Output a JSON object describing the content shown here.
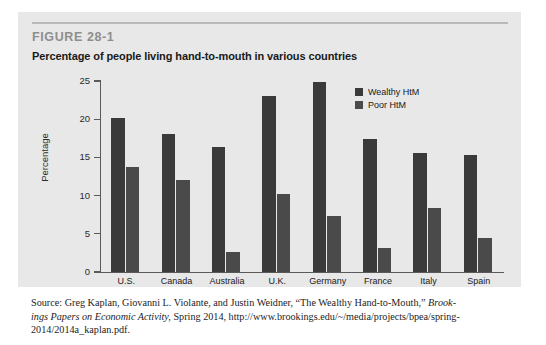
{
  "figure": {
    "number": "FIGURE 28-1",
    "title": "Percentage of people living hand-to-mouth in various countries"
  },
  "source": {
    "line1_pre": "Source: Greg Kaplan, Giovanni L. Violante, and Justin Weidner, “The Wealthy Hand-to-Mouth,” ",
    "line1_italic": "Brook-",
    "line2_italic": "ings Papers on Economic Activity,",
    "line2_post": " Spring 2014, http://www.brookings.edu/~/media/projects/bpea/spring-",
    "line3": "2014/2014a_kaplan.pdf."
  },
  "colors": {
    "panel_background": "#e8e8e8",
    "wealthy_bar": "#3a3a3a",
    "poor_bar": "#4a4a4a",
    "axis": "#5a5a5a",
    "figure_number": "#8e8e8e"
  },
  "chart_data": {
    "type": "bar",
    "title": "Percentage of people living hand-to-mouth in various countries",
    "xlabel": "",
    "ylabel": "Percentage",
    "ylim": [
      0,
      25
    ],
    "yticks": [
      0,
      5,
      10,
      15,
      20,
      25
    ],
    "ytick_labels": [
      "0",
      "5",
      "10",
      "15",
      "20",
      "25"
    ],
    "grid": false,
    "legend_position": "upper-right-inside",
    "categories": [
      "U.S.",
      "Canada",
      "Australia",
      "U.K.",
      "Germany",
      "France",
      "Italy",
      "Spain"
    ],
    "series": [
      {
        "name": "Wealthy HtM",
        "color": "#3a3a3a",
        "values": [
          20.2,
          18.0,
          16.4,
          23.1,
          24.9,
          17.4,
          15.6,
          15.3
        ]
      },
      {
        "name": "Poor HtM",
        "color": "#4a4a4a",
        "values": [
          13.7,
          12.1,
          2.6,
          10.2,
          7.3,
          3.1,
          8.4,
          4.5
        ]
      }
    ]
  }
}
